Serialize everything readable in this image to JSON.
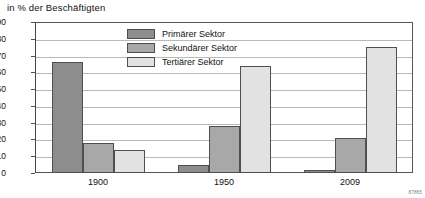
{
  "chart_data": {
    "type": "bar",
    "title": "in % der Beschäftigten",
    "xlabel": "",
    "ylabel": "in % der Beschäftigten",
    "categories": [
      "1900",
      "1950",
      "2009"
    ],
    "series": [
      {
        "name": "Primärer Sektor",
        "color": "#8d8d8d",
        "values": [
          66,
          5,
          2
        ]
      },
      {
        "name": "Sekundärer Sektor",
        "color": "#a8a8a8",
        "values": [
          18,
          28,
          21
        ]
      },
      {
        "name": "Tertiärer Sektor",
        "color": "#e2e2e2",
        "values": [
          14,
          64,
          75
        ]
      }
    ],
    "ylim": [
      0,
      90
    ],
    "yticks": [
      0,
      10,
      20,
      30,
      40,
      50,
      60,
      70,
      80,
      90
    ],
    "ytick_labels": [
      "0",
      "10",
      "20",
      "30",
      "40",
      "50",
      "60",
      "70",
      "80",
      "90"
    ],
    "grid": true,
    "legend_position": "top-center"
  },
  "legend": {
    "items": [
      {
        "label": "Primärer Sektor"
      },
      {
        "label": "Sekundärer Sektor"
      },
      {
        "label": "Tertiärer Sektor"
      }
    ]
  },
  "footer": {
    "code": "87865"
  }
}
